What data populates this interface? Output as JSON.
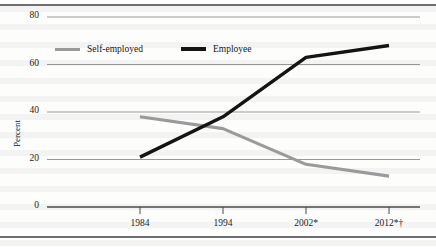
{
  "figure": {
    "background_color": "#fdfdfc",
    "rule_color": "#6e6e72"
  },
  "chart_data": {
    "type": "line",
    "title": "",
    "subtitle": "",
    "xlabel": "",
    "ylabel": "Percent",
    "categories": [
      "1984",
      "1994",
      "2002*",
      "2012*†"
    ],
    "x": [
      1984,
      1994,
      2002,
      2012
    ],
    "series": [
      {
        "name": "Self-employed",
        "color": "#9a9a9a",
        "values": [
          38,
          33,
          18,
          13
        ]
      },
      {
        "name": "Employee",
        "color": "#141414",
        "values": [
          21,
          38,
          63,
          68
        ]
      }
    ],
    "ylim": [
      0,
      80
    ],
    "yticks": [
      0,
      20,
      40,
      60,
      80
    ],
    "ytick_labels": [
      "0",
      "20",
      "40",
      "60",
      "80"
    ],
    "grid": true,
    "grid_axis": "y",
    "legend_position": "top-left-inside"
  },
  "legend": {
    "entries": [
      {
        "label": "Self-employed",
        "color": "#9a9a9a"
      },
      {
        "label": "Employee",
        "color": "#141414"
      }
    ]
  }
}
